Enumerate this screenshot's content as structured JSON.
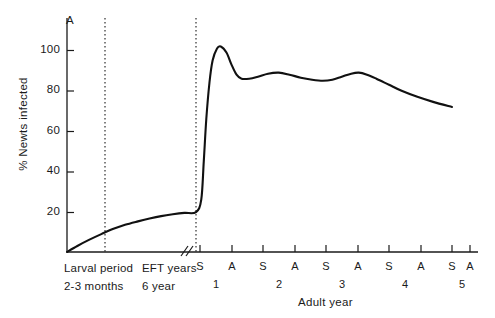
{
  "chart_data": {
    "type": "line",
    "title": "",
    "panel_label": "A",
    "ylabel": "% Newts infected",
    "xlabel": "Adult year",
    "ylim": [
      0,
      110
    ],
    "yticks": [
      20,
      40,
      60,
      80,
      100
    ],
    "grid": false,
    "legend": null,
    "x_phases": [
      {
        "name": "larval",
        "label_line1": "Larval period",
        "label_line2": "2-3 months"
      },
      {
        "name": "eft",
        "label_line1": "EFT years",
        "label_line2": "6 year"
      },
      {
        "name": "adult",
        "label_line1": "Adult year",
        "label_line2": ""
      }
    ],
    "adult_season_ticks": [
      "S",
      "A",
      "S",
      "A",
      "S",
      "A",
      "S",
      "A",
      "S",
      "A"
    ],
    "adult_year_labels": [
      "1",
      "2",
      "3",
      "4",
      "5"
    ],
    "axis_break": "//",
    "dividers": [
      {
        "name": "larval-eft-divider",
        "style": "dotted"
      },
      {
        "name": "eft-adult-divider",
        "style": "dotted"
      }
    ],
    "series": [
      {
        "name": "% Newts infected",
        "color": "#111111",
        "points": [
          {
            "x": 0.0,
            "y": 0
          },
          {
            "x": 0.08,
            "y": 3.0
          },
          {
            "x": 0.17,
            "y": 6.0
          },
          {
            "x": 0.27,
            "y": 9.0
          },
          {
            "x": 0.36,
            "y": 11.5
          },
          {
            "x": 0.45,
            "y": 13.5
          },
          {
            "x": 0.55,
            "y": 15.2
          },
          {
            "x": 0.64,
            "y": 16.6
          },
          {
            "x": 0.73,
            "y": 17.8
          },
          {
            "x": 0.82,
            "y": 18.7
          },
          {
            "x": 0.91,
            "y": 19.4
          },
          {
            "x": 1.0,
            "y": 19.8
          },
          {
            "x": 1.02,
            "y": 26
          },
          {
            "x": 1.06,
            "y": 45
          },
          {
            "x": 1.1,
            "y": 66
          },
          {
            "x": 1.15,
            "y": 84
          },
          {
            "x": 1.2,
            "y": 95
          },
          {
            "x": 1.27,
            "y": 101
          },
          {
            "x": 1.33,
            "y": 102
          },
          {
            "x": 1.42,
            "y": 99
          },
          {
            "x": 1.5,
            "y": 93
          },
          {
            "x": 1.58,
            "y": 88
          },
          {
            "x": 1.66,
            "y": 86
          },
          {
            "x": 1.78,
            "y": 86
          },
          {
            "x": 1.92,
            "y": 87
          },
          {
            "x": 2.08,
            "y": 88.5
          },
          {
            "x": 2.25,
            "y": 89
          },
          {
            "x": 2.42,
            "y": 88
          },
          {
            "x": 2.6,
            "y": 86.5
          },
          {
            "x": 2.78,
            "y": 85.5
          },
          {
            "x": 2.95,
            "y": 85
          },
          {
            "x": 3.1,
            "y": 85.5
          },
          {
            "x": 3.25,
            "y": 87
          },
          {
            "x": 3.4,
            "y": 88.5
          },
          {
            "x": 3.52,
            "y": 89
          },
          {
            "x": 3.65,
            "y": 88
          },
          {
            "x": 3.8,
            "y": 86
          },
          {
            "x": 4.0,
            "y": 83
          },
          {
            "x": 4.2,
            "y": 80
          },
          {
            "x": 4.45,
            "y": 77
          },
          {
            "x": 4.7,
            "y": 74.5
          },
          {
            "x": 5.0,
            "y": 72
          }
        ]
      }
    ]
  },
  "axes": {
    "y_tick_labels": [
      "100",
      "80",
      "60",
      "40",
      "20"
    ],
    "panel_letter": "A",
    "y_title": "% Newts infected"
  },
  "x_axis": {
    "larval_line1": "Larval period",
    "larval_line2": "2-3 months",
    "eft_line1": "EFT years",
    "eft_line2": "6 year",
    "adult_title": "Adult year",
    "season_labels": [
      "S",
      "A",
      "S",
      "A",
      "S",
      "A",
      "S",
      "A",
      "S",
      "A"
    ],
    "year_labels": [
      "1",
      "2",
      "3",
      "4",
      "5"
    ]
  }
}
